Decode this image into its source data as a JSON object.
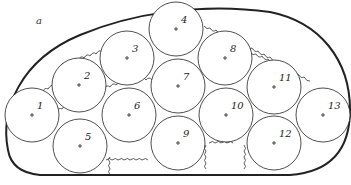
{
  "figure": {
    "panel_label": "a",
    "colors": {
      "stroke": "#222222",
      "background": "#ffffff"
    },
    "circles": [
      {
        "id": "1",
        "cx": 32,
        "cy": 115,
        "r": 27
      },
      {
        "id": "2",
        "cx": 79,
        "cy": 85,
        "r": 27
      },
      {
        "id": "3",
        "cx": 127,
        "cy": 58,
        "r": 27
      },
      {
        "id": "4",
        "cx": 176,
        "cy": 29,
        "r": 27
      },
      {
        "id": "5",
        "cx": 80,
        "cy": 146,
        "r": 27
      },
      {
        "id": "6",
        "cx": 129,
        "cy": 115,
        "r": 27
      },
      {
        "id": "7",
        "cx": 178,
        "cy": 86,
        "r": 27
      },
      {
        "id": "8",
        "cx": 225,
        "cy": 58,
        "r": 27
      },
      {
        "id": "9",
        "cx": 178,
        "cy": 143,
        "r": 27
      },
      {
        "id": "10",
        "cx": 226,
        "cy": 115,
        "r": 27
      },
      {
        "id": "11",
        "cx": 274,
        "cy": 87,
        "r": 27
      },
      {
        "id": "12",
        "cx": 274,
        "cy": 143,
        "r": 27
      },
      {
        "id": "13",
        "cx": 323,
        "cy": 115,
        "r": 27
      }
    ]
  }
}
